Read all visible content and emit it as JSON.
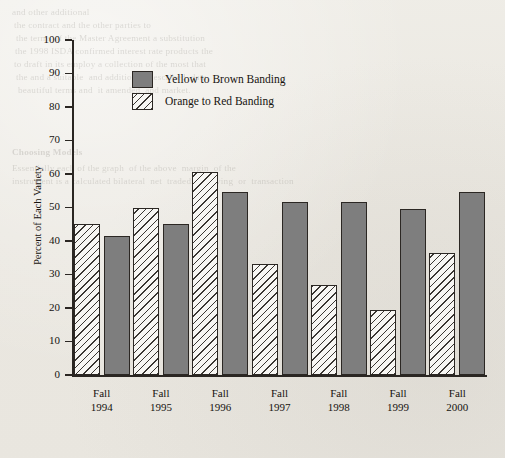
{
  "chart_data": {
    "type": "bar",
    "title": "",
    "xlabel": "",
    "ylabel": "Percent of Each Variety",
    "ylim": [
      0,
      100
    ],
    "ytick_step": 10,
    "yticks": [
      0,
      10,
      20,
      30,
      40,
      50,
      60,
      70,
      80,
      90,
      100
    ],
    "ytick_labels": [
      "0",
      "10",
      "20",
      "30",
      "40",
      "50",
      "60",
      "70",
      "80",
      "90",
      "100"
    ],
    "grid": false,
    "legend_position": "upper-left-inside",
    "categories": [
      "Fall\n1994",
      "Fall\n1995",
      "Fall\n1996",
      "Fall\n1997",
      "Fall\n1998",
      "Fall\n1999",
      "Fall\n2000"
    ],
    "category_labels_flat": [
      "Fall 1994",
      "Fall 1995",
      "Fall 1996",
      "Fall 1997",
      "Fall 1998",
      "Fall 1999",
      "Fall 2000"
    ],
    "series": [
      {
        "name": "Orange to Red Banding",
        "pattern": "diagonal-hatch",
        "fill": "#f7f6f3",
        "hatch_color": "#3a3632",
        "draw_order": 0,
        "values": [
          45,
          50,
          60.5,
          33,
          27,
          19.5,
          36.5
        ]
      },
      {
        "name": "Yellow to Brown Banding",
        "pattern": "solid",
        "fill": "#7e7e7e",
        "draw_order": 1,
        "values": [
          41.5,
          45,
          54.5,
          51.5,
          51.5,
          49.5,
          54.5
        ]
      }
    ]
  },
  "legend": {
    "entries": [
      {
        "label": "Yellow to Brown Banding",
        "swatch": "solid"
      },
      {
        "label": "Orange to Red Banding",
        "swatch": "hatch"
      }
    ]
  },
  "axes": {
    "y_title": "Percent of Each Variety"
  },
  "page_bleed": {
    "lines": [
      "and other additional",
      "the contract and the other parties to",
      "the terms of the Master Agreement a substitution",
      "the 1998 ISDA confirmed interest rate products the",
      "to draft in its employ a collection of the most that",
      "the and a suitable  and additional  described  data",
      "beautiful terms and  it amended  and market."
    ],
    "heading": "Choosing Models",
    "sub_lines": [
      "Essentially each of the graph  of the above  margin  of the",
      "instrument is a calculated bilateral  net  traded  revolving  or  transaction"
    ]
  }
}
